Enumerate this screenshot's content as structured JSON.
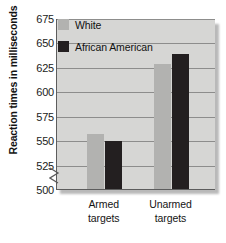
{
  "chart_data": {
    "type": "bar",
    "title": "",
    "xlabel": "",
    "ylabel": "Reaction times in milliseconds",
    "categories": [
      "Armed targets",
      "Unarmed targets"
    ],
    "category_lines": [
      [
        "Armed",
        "targets"
      ],
      [
        "Unarmed",
        "targets"
      ]
    ],
    "series": [
      {
        "name": "White",
        "color": "#b2b2b0",
        "values": [
          556,
          628
        ]
      },
      {
        "name": "African American",
        "color": "#231f20",
        "values": [
          549,
          638
        ]
      }
    ],
    "ylim": [
      500,
      675
    ],
    "yticks": [
      500,
      525,
      550,
      575,
      600,
      625,
      650,
      675
    ],
    "ytick_labels": [
      "500",
      "525",
      "550",
      "575",
      "600",
      "625",
      "650",
      "675"
    ],
    "y_axis_break": true,
    "y_axis_break_icon": "axis-break-zigzag",
    "grid": true,
    "grid_axis": "y",
    "legend_position": "top-left-inside",
    "plot_background": "#d6d6d4",
    "grid_color": "#8d8d8c",
    "axis_color": "#5d5d5d",
    "units": "milliseconds"
  },
  "legend": {
    "items": [
      {
        "label": "White",
        "swatch": "white"
      },
      {
        "label": "African American",
        "swatch": "black"
      }
    ]
  }
}
